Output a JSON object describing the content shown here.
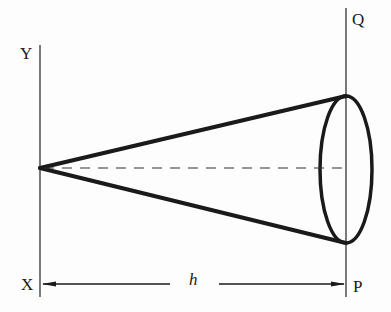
{
  "diagram": {
    "type": "cone",
    "labels": {
      "Y": "Y",
      "X": "X",
      "Q": "Q",
      "P": "P",
      "h": "h"
    },
    "elements": {
      "left_line": {
        "name": "XY",
        "x": 40,
        "y1": 45,
        "y2": 297
      },
      "right_line": {
        "name": "PQ",
        "x": 346,
        "y1": 8,
        "y2": 297
      },
      "apex": {
        "x": 40,
        "y": 168
      },
      "base_top": {
        "x": 346,
        "y": 96
      },
      "base_bottom": {
        "x": 346,
        "y": 243
      },
      "base_ellipse": {
        "cx": 346,
        "cy": 169.5,
        "rx": 26,
        "ry": 73.5
      },
      "axis": {
        "style": "dashed",
        "y": 168,
        "x1": 40,
        "x2": 346
      },
      "height_arrow": {
        "y": 284,
        "x1": 42,
        "x2": 344,
        "label": "h",
        "double_headed": true
      }
    },
    "colors": {
      "stroke": "#1a1a1a",
      "background": "#fdfdfd"
    }
  }
}
